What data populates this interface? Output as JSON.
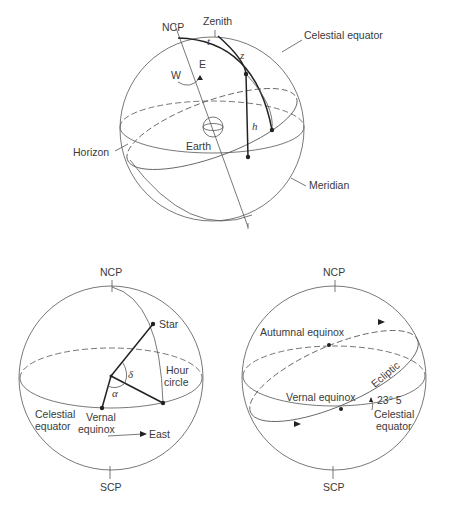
{
  "figure": {
    "top_diagram": {
      "name": "horizon-and-equatorial-systems",
      "labels": {
        "zenith": "Zenith",
        "ncp": "NCP",
        "scp": "SCP",
        "celestial_equator": "Celestial equator",
        "horizon": "Horizon",
        "meridian": "Meridian",
        "earth": "Earth",
        "west": "W",
        "east": "E",
        "angle_t": "t",
        "angle_z": "z",
        "angle_h": "h"
      }
    },
    "bottom_left_diagram": {
      "name": "equatorial-coordinates",
      "labels": {
        "ncp": "NCP",
        "scp": "SCP",
        "star": "Star",
        "hour_circle_line1": "Hour",
        "hour_circle_line2": "circle",
        "delta": "δ",
        "alpha": "α",
        "celestial_equator_line1": "Celestial",
        "celestial_equator_line2": "equator",
        "vernal_equinox_line1": "Vernal",
        "vernal_equinox_line2": "equinox",
        "east": "East"
      }
    },
    "bottom_right_diagram": {
      "name": "ecliptic-and-equinoxes",
      "labels": {
        "ncp": "NCP",
        "scp": "SCP",
        "autumnal_equinox": "Autumnal equinox",
        "vernal_equinox": "Vernal equinox",
        "ecliptic": "Ecliptic",
        "obliquity": "23° 5",
        "celestial_equator_line1": "Celestial",
        "celestial_equator_line2": "equator"
      }
    }
  }
}
